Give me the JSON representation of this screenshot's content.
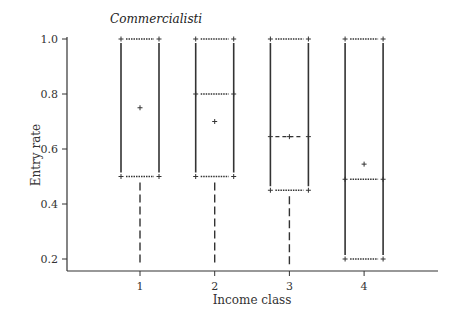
{
  "chart_data": {
    "type": "box",
    "title": "Commercialisti",
    "xlabel": "Income class",
    "ylabel": "Entry rate",
    "categories": [
      "1",
      "2",
      "3",
      "4"
    ],
    "yticks": [
      "0.2",
      "0.4",
      "0.6",
      "0.8",
      "1.0"
    ],
    "ylim": [
      0.16,
      1.0
    ],
    "grid": false,
    "series": [
      {
        "category": "1",
        "q3": 1.0,
        "median": null,
        "q1": 0.5,
        "mean": 0.75,
        "whisker_low": 0.18,
        "whisker_high": 1.0
      },
      {
        "category": "2",
        "q3": 1.0,
        "median": 0.8,
        "q1": 0.5,
        "mean": 0.7,
        "whisker_low": 0.18,
        "whisker_high": 1.0
      },
      {
        "category": "3",
        "q3": 1.0,
        "median": 0.645,
        "q1": 0.45,
        "mean": 0.645,
        "whisker_low": 0.18,
        "whisker_high": 1.0
      },
      {
        "category": "4",
        "q3": 1.0,
        "median": 0.49,
        "q1": 0.2,
        "mean": 0.545,
        "whisker_low": 0.2,
        "whisker_high": 1.0
      }
    ],
    "colors": {
      "line": "#333333",
      "background": "#ffffff"
    }
  }
}
